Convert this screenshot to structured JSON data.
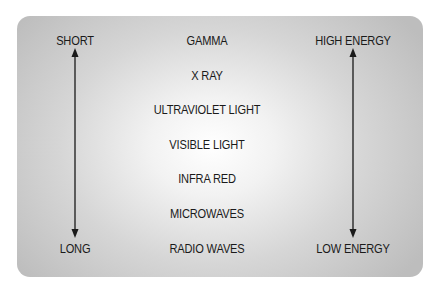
{
  "diagram": {
    "wavelength_axis": {
      "top": "SHORT",
      "bottom": "LONG"
    },
    "energy_axis": {
      "top": "HIGH ENERGY",
      "bottom": "LOW ENERGY"
    },
    "bands": [
      "GAMMA",
      "X RAY",
      "ULTRAVIOLET LIGHT",
      "VISIBLE LIGHT",
      "INFRA RED",
      "MICROWAVES",
      "RADIO WAVES"
    ],
    "colors": {
      "text": "#1a1a1a",
      "panel_edge": "#bdbdbd",
      "panel_center": "#ffffff"
    }
  }
}
